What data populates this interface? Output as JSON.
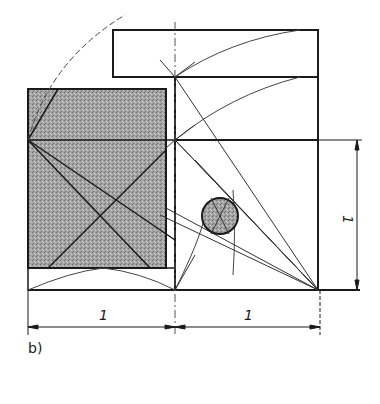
{
  "figure": {
    "caption": "b)",
    "colors": {
      "ink": "#1a1a1a",
      "thin": "#555555",
      "shade": "#9a9a9a",
      "background": "#ffffff"
    },
    "dimensions": {
      "bottom_left_label": "1",
      "bottom_right_label": "1",
      "right_vertical_label": "1"
    },
    "elements": {
      "top_rectangle": "golden-section extension rectangle",
      "right_square": "unit square",
      "shaded_rectangle": "shaded rectangle",
      "circle": "shaded circle at construction intersection"
    }
  }
}
